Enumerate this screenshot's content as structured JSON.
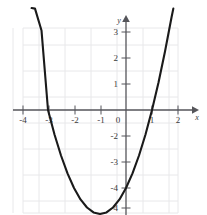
{
  "figure": {
    "kind": "cartesian-graph",
    "background_color": "#ffffff",
    "grid_color": "#e8e8ea",
    "axis_color": "#55555a",
    "curve_color": "#1a1a1a",
    "label_color": "#3a3a3a"
  },
  "chart_data": {
    "type": "line",
    "title": "",
    "xlabel": "x",
    "ylabel": "y",
    "equation": "y = x^2 + 2x - 3",
    "xlim": [
      -4.5,
      2.0
    ],
    "ylim": [
      -4.5,
      3.5
    ],
    "grid": true,
    "grid_step": 1,
    "legend": "none",
    "origin_label": "0",
    "xticks": [
      -4,
      -3,
      -2,
      -1,
      1,
      2
    ],
    "xtick_labels": [
      "-4",
      "-3",
      "-2",
      "-1",
      "1",
      "2"
    ],
    "yticks": [
      -4,
      -3,
      -2,
      -1,
      1,
      2,
      3
    ],
    "ytick_labels": [
      "-4",
      "-3",
      "-2",
      "-1",
      "1",
      "2",
      "3"
    ],
    "x": [
      -3.63,
      -3.5,
      -3.25,
      -3.0,
      -2.75,
      -2.5,
      -2.25,
      -2.0,
      -1.75,
      -1.5,
      -1.25,
      -1.0,
      -0.75,
      -0.5,
      -0.25,
      0.0,
      0.25,
      0.5,
      0.75,
      1.0,
      1.25,
      1.5,
      1.75,
      1.82
    ],
    "y": [
      3.92,
      3.9,
      3.06,
      0.0,
      -0.94,
      -1.75,
      -2.44,
      -3.0,
      -3.44,
      -3.75,
      -3.94,
      -4.0,
      -3.94,
      -3.75,
      -3.44,
      -3.0,
      -2.44,
      -1.75,
      -0.94,
      0.0,
      1.06,
      2.25,
      3.56,
      3.9
    ],
    "roots": [
      -3,
      1
    ],
    "vertex": [
      -1,
      -4
    ],
    "y_intercept": -3
  }
}
